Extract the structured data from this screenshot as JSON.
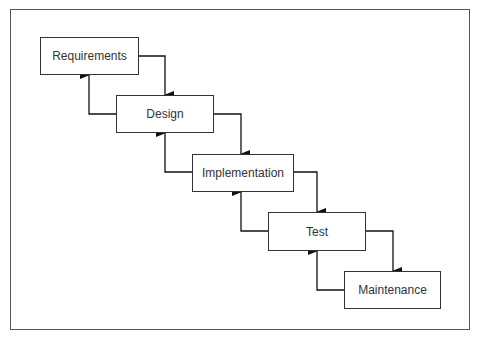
{
  "diagram": {
    "stages": [
      {
        "label": "Requirements"
      },
      {
        "label": "Design"
      },
      {
        "label": "Implementation"
      },
      {
        "label": "Test"
      },
      {
        "label": "Maintenance"
      }
    ],
    "colors": {
      "line": "#111111",
      "box_border": "#333333",
      "frame": "#555555",
      "text": "#333333"
    }
  }
}
